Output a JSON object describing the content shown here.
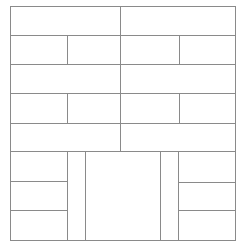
{
  "diagram": {
    "line_color": "#8a8a8a",
    "background": "#ffffff",
    "cells": [
      {
        "id": "r1-left",
        "x": 10,
        "y": 6,
        "w": 111,
        "h": 30
      },
      {
        "id": "r1-right",
        "x": 120,
        "y": 6,
        "w": 116,
        "h": 30
      },
      {
        "id": "r2-a",
        "x": 10,
        "y": 35,
        "w": 58,
        "h": 30
      },
      {
        "id": "r2-b",
        "x": 67,
        "y": 35,
        "w": 54,
        "h": 30
      },
      {
        "id": "r2-c",
        "x": 120,
        "y": 35,
        "w": 60,
        "h": 30
      },
      {
        "id": "r2-d",
        "x": 179,
        "y": 35,
        "w": 57,
        "h": 30
      },
      {
        "id": "r3-left",
        "x": 10,
        "y": 64,
        "w": 111,
        "h": 30
      },
      {
        "id": "r3-right",
        "x": 120,
        "y": 64,
        "w": 116,
        "h": 30
      },
      {
        "id": "r4-a",
        "x": 10,
        "y": 93,
        "w": 58,
        "h": 31
      },
      {
        "id": "r4-b",
        "x": 67,
        "y": 93,
        "w": 54,
        "h": 31
      },
      {
        "id": "r4-c",
        "x": 120,
        "y": 93,
        "w": 60,
        "h": 31
      },
      {
        "id": "r4-d",
        "x": 179,
        "y": 93,
        "w": 57,
        "h": 31
      },
      {
        "id": "r5-left",
        "x": 10,
        "y": 123,
        "w": 111,
        "h": 29
      },
      {
        "id": "r5-right",
        "x": 120,
        "y": 123,
        "w": 116,
        "h": 29
      },
      {
        "id": "b-left-1",
        "x": 10,
        "y": 151,
        "w": 58,
        "h": 31
      },
      {
        "id": "b-left-2",
        "x": 10,
        "y": 181,
        "w": 58,
        "h": 30
      },
      {
        "id": "b-left-3",
        "x": 10,
        "y": 210,
        "w": 58,
        "h": 31
      },
      {
        "id": "b-left-narrow",
        "x": 67,
        "y": 151,
        "w": 19,
        "h": 90
      },
      {
        "id": "b-center",
        "x": 85,
        "y": 151,
        "w": 76,
        "h": 90
      },
      {
        "id": "b-right-narrow",
        "x": 160,
        "y": 151,
        "w": 19,
        "h": 90
      },
      {
        "id": "b-right-1",
        "x": 178,
        "y": 151,
        "w": 58,
        "h": 32
      },
      {
        "id": "b-right-2",
        "x": 178,
        "y": 182,
        "w": 58,
        "h": 29
      },
      {
        "id": "b-right-3",
        "x": 178,
        "y": 210,
        "w": 58,
        "h": 31
      }
    ]
  }
}
